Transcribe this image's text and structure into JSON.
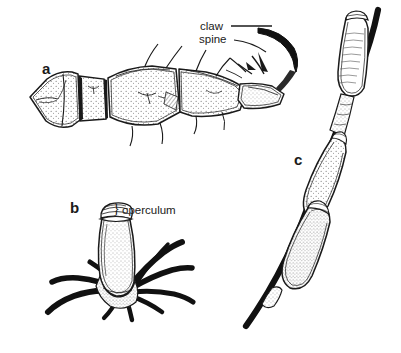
{
  "figure": {
    "width": 401,
    "height": 353,
    "background_color": "#ffffff",
    "ink_color": "#1a1a1a",
    "stipple_color": "#3a3a3a",
    "panels": [
      {
        "letter": "a",
        "name": "louse-leg-with-claw",
        "description": "Lateral view of a segmented louse leg, stippled cuticle, terminating in a dark curved claw with spines"
      },
      {
        "letter": "b",
        "name": "nit-on-hair-cluster",
        "description": "Single egg (nit) with operculum cap, cemented at its base to a radiating cluster of dark hairs"
      },
      {
        "letter": "c",
        "name": "nits-along-hair-shaft",
        "description": "Three elongated eggs (nits) cemented in series along a single thick dark hair shaft running diagonally"
      }
    ],
    "callouts": [
      {
        "name": "claw",
        "label": "claw",
        "leader": true
      },
      {
        "name": "spine",
        "label": "spine",
        "leader": true
      },
      {
        "name": "operculum",
        "label": "operculum",
        "brace": "}"
      }
    ]
  }
}
